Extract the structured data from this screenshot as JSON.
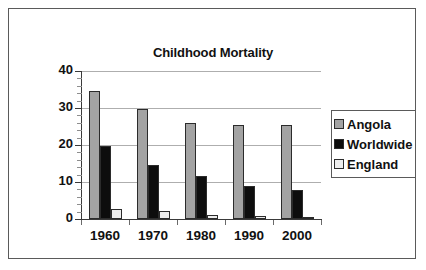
{
  "chart_data": {
    "type": "bar",
    "title": "Childhood Mortality",
    "xlabel": "",
    "ylabel": "% dying by age five",
    "categories": [
      "1960",
      "1970",
      "1980",
      "1990",
      "2000"
    ],
    "series": [
      {
        "name": "Angola",
        "color": "#a3a3a3",
        "values": [
          34.5,
          29.8,
          26.0,
          25.5,
          25.4
        ]
      },
      {
        "name": "Worldwide",
        "color": "#0d0d0d",
        "values": [
          19.8,
          14.6,
          11.5,
          9.0,
          7.8
        ]
      },
      {
        "name": "England",
        "color": "#ededed",
        "values": [
          2.6,
          2.2,
          1.1,
          0.8,
          0.5
        ]
      }
    ],
    "ylim": [
      0,
      40
    ],
    "y_ticks": [
      0,
      10,
      20,
      30,
      40
    ],
    "y_tick_labels": [
      "0",
      "10",
      "20",
      "30",
      "40"
    ],
    "y_minor_tick_step": 2,
    "grid": "horizontal",
    "legend_position": "right"
  },
  "legend": {
    "items": [
      {
        "label": "Angola"
      },
      {
        "label": "Worldwide"
      },
      {
        "label": "England"
      }
    ]
  }
}
